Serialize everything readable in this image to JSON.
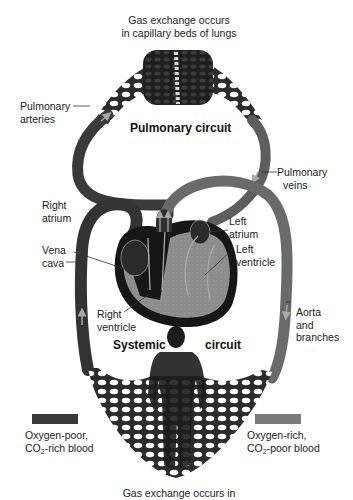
{
  "diagram": {
    "top_caption": [
      "Gas exchange occurs",
      "in capillary beds of lungs"
    ],
    "bottom_caption_partial": "Gas exchange occurs in",
    "circuits": {
      "pulmonary": "Pulmonary circuit",
      "systemic_left": "Systemic",
      "systemic_right": "circuit"
    },
    "labels": {
      "pulmonary_arteries": [
        "Pulmonary",
        "arteries"
      ],
      "pulmonary_veins": [
        "Pulmonary",
        "veins"
      ],
      "right_atrium": [
        "Right",
        "atrium"
      ],
      "vena_cava": [
        "Vena",
        "cava"
      ],
      "left_atrium": [
        "Left",
        "atrium"
      ],
      "left_ventricle": [
        "Left",
        "ventricle"
      ],
      "right_ventricle": [
        "Right",
        "ventricle"
      ],
      "aorta": [
        "Aorta",
        "and",
        "branches"
      ]
    },
    "legend": [
      {
        "line1": "Oxygen-poor,",
        "co2_prefix": "CO",
        "co2_sub": "2",
        "co2_suffix": "-rich blood",
        "color": "#3a3a3a"
      },
      {
        "line1": "Oxygen-rich,",
        "co2_prefix": "CO",
        "co2_sub": "2",
        "co2_suffix": "-poor blood",
        "color": "#7a7a7a"
      }
    ],
    "colors": {
      "oxygen_poor": "#3a3a3a",
      "oxygen_rich": "#7a7a7a",
      "arrow": "#a8a8a8",
      "background": "#ffffff"
    }
  }
}
